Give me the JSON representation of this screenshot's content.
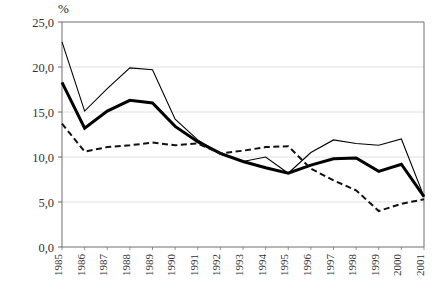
{
  "chart_data": {
    "type": "line",
    "title": "",
    "subtitle": "",
    "xlabel": "",
    "ylabel": "%",
    "ylim": [
      0.0,
      25.0
    ],
    "yticks": [
      0.0,
      5.0,
      10.0,
      15.0,
      20.0,
      25.0
    ],
    "ytick_labels": [
      "0,0",
      "5,0",
      "10,0",
      "15,0",
      "20,0",
      "25,0"
    ],
    "grid": true,
    "legend": "none",
    "decimal_separator": ",",
    "categories": [
      "1985",
      "1986",
      "1987",
      "1988",
      "1989",
      "1990",
      "1991",
      "1992",
      "1993",
      "1994",
      "1995",
      "1996",
      "1997",
      "1998",
      "1999",
      "2000",
      "2001"
    ],
    "series": [
      {
        "name": "thin-solid-line",
        "style": "solid-thin",
        "color": "#000000",
        "values": [
          22.8,
          15.1,
          17.6,
          19.9,
          19.7,
          14.2,
          11.9,
          10.3,
          9.5,
          10.0,
          8.2,
          10.5,
          11.9,
          11.5,
          11.3,
          12.0,
          5.6
        ]
      },
      {
        "name": "thick-solid-line",
        "style": "solid-thick",
        "color": "#000000",
        "values": [
          18.3,
          13.2,
          15.1,
          16.3,
          16.0,
          13.4,
          11.7,
          10.4,
          9.5,
          8.8,
          8.2,
          9.1,
          9.8,
          9.9,
          8.4,
          9.2,
          5.6
        ]
      },
      {
        "name": "dash-dot-line",
        "style": "dash-dot",
        "color": "#111111",
        "values": [
          13.7,
          10.6,
          11.1,
          11.3,
          11.6,
          11.3,
          11.5,
          10.4,
          10.7,
          11.1,
          11.2,
          8.7,
          7.4,
          6.3,
          4.0,
          4.8,
          5.3
        ]
      }
    ]
  },
  "axis": {
    "y_unit_label": "%"
  }
}
